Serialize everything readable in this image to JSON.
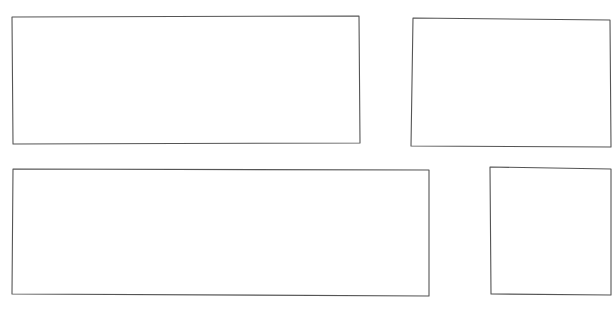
{
  "diagram": {
    "background": "#ffffff",
    "stroke_color": "#555555",
    "boxes": [
      {
        "id": "box-top-left",
        "points": [
          [
            12,
            17
          ],
          [
            359,
            16
          ],
          [
            360,
            143
          ],
          [
            13,
            144
          ]
        ]
      },
      {
        "id": "box-top-right",
        "points": [
          [
            413,
            18
          ],
          [
            610,
            20
          ],
          [
            611,
            147
          ],
          [
            411,
            146
          ]
        ]
      },
      {
        "id": "box-bottom-left",
        "points": [
          [
            13,
            169
          ],
          [
            429,
            170
          ],
          [
            429,
            296
          ],
          [
            12,
            294
          ]
        ]
      },
      {
        "id": "box-bottom-right",
        "points": [
          [
            490,
            167
          ],
          [
            611,
            169
          ],
          [
            611,
            295
          ],
          [
            491,
            294
          ]
        ]
      }
    ]
  }
}
